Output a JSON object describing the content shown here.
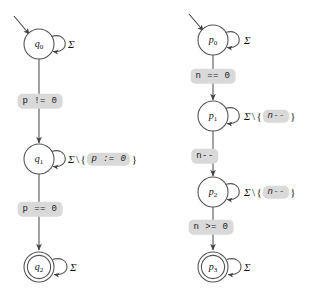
{
  "figure": {
    "type": "finite-state-automata-pair",
    "background_color": "#ffffff",
    "stroke_color": "#555555",
    "text_color": "#111111",
    "chip_background": "#d9d9d9",
    "alphabet_symbol": "Σ",
    "set_minus_symbol": "\\",
    "brace_open": "{",
    "brace_close": "}"
  },
  "automata": [
    {
      "id": "left-automaton",
      "name": "pointer-automaton",
      "states": [
        {
          "id": "q0",
          "base": "q",
          "index": "0",
          "accepting": false,
          "initial": true,
          "cx": 39,
          "cy": 44,
          "r": 15,
          "self_loop_label": "Σ",
          "self_loop_guard_chip": null
        },
        {
          "id": "q1",
          "base": "q",
          "index": "1",
          "accepting": false,
          "initial": false,
          "cx": 39,
          "cy": 159,
          "r": 15,
          "self_loop_label": "Σ",
          "self_loop_guard_chip": "p := 0"
        },
        {
          "id": "q2",
          "base": "q",
          "index": "2",
          "accepting": true,
          "initial": false,
          "cx": 39,
          "cy": 267,
          "r": 15,
          "self_loop_label": "Σ",
          "self_loop_guard_chip": null
        }
      ],
      "transitions": [
        {
          "from": "q0",
          "to": "q1",
          "label": "p != 0",
          "label_x": 40,
          "label_y": 101
        },
        {
          "from": "q1",
          "to": "q2",
          "label": "p == 0",
          "label_x": 40,
          "label_y": 209
        }
      ],
      "self_loop_texts": [
        {
          "state": "q0",
          "x": 68,
          "y": 44,
          "sigma": "Σ",
          "restricted": false,
          "chip": null
        },
        {
          "state": "q1",
          "x": 68,
          "y": 159,
          "sigma": "Σ",
          "restricted": true,
          "chip": "p := 0"
        },
        {
          "state": "q2",
          "x": 70,
          "y": 267,
          "sigma": "Σ",
          "restricted": false,
          "chip": null
        }
      ]
    },
    {
      "id": "right-automaton",
      "name": "counter-automaton",
      "states": [
        {
          "id": "p0",
          "base": "p",
          "index": "0",
          "accepting": false,
          "initial": true,
          "cx": 213,
          "cy": 40,
          "r": 15,
          "self_loop_label": "Σ",
          "self_loop_guard_chip": null
        },
        {
          "id": "p1",
          "base": "p",
          "index": "1",
          "accepting": false,
          "initial": false,
          "cx": 213,
          "cy": 116,
          "r": 15,
          "self_loop_label": "Σ",
          "self_loop_guard_chip": "n--"
        },
        {
          "id": "p2",
          "base": "p",
          "index": "2",
          "accepting": false,
          "initial": false,
          "cx": 213,
          "cy": 192,
          "r": 15,
          "self_loop_label": "Σ",
          "self_loop_guard_chip": "n--"
        },
        {
          "id": "p3",
          "base": "p",
          "index": "3",
          "accepting": true,
          "initial": false,
          "cx": 213,
          "cy": 267,
          "r": 15,
          "self_loop_label": "Σ",
          "self_loop_guard_chip": null
        }
      ],
      "transitions": [
        {
          "from": "p0",
          "to": "p1",
          "label": "n == 0",
          "label_x": 213,
          "label_y": 76
        },
        {
          "from": "p1",
          "to": "p2",
          "label": "n--",
          "label_x": 205,
          "label_y": 156
        },
        {
          "from": "p2",
          "to": "p3",
          "label": "n >= 0",
          "label_x": 211,
          "label_y": 227
        }
      ],
      "self_loop_texts": [
        {
          "state": "p0",
          "x": 244,
          "y": 40,
          "sigma": "Σ",
          "restricted": false,
          "chip": null
        },
        {
          "state": "p1",
          "x": 244,
          "y": 116,
          "sigma": "Σ",
          "restricted": true,
          "chip": "n--"
        },
        {
          "state": "p2",
          "x": 244,
          "y": 192,
          "sigma": "Σ",
          "restricted": true,
          "chip": "n--"
        },
        {
          "state": "p3",
          "x": 244,
          "y": 267,
          "sigma": "Σ",
          "restricted": false,
          "chip": null
        }
      ]
    }
  ]
}
